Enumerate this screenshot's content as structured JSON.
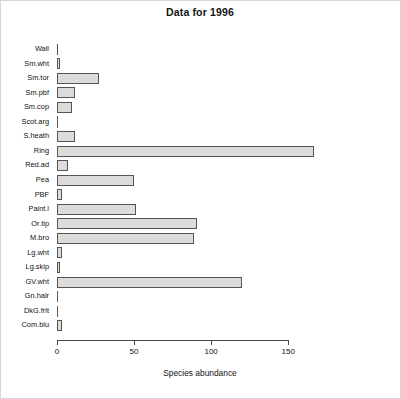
{
  "chart_data": {
    "type": "bar",
    "orientation": "horizontal",
    "title": "Data for 1996",
    "xlabel": "Species abundance",
    "ylabel": "",
    "xlim": [
      0,
      170
    ],
    "xticks": [
      0,
      50,
      100,
      150
    ],
    "xtick_labels": [
      "0",
      "50",
      "100",
      "150"
    ],
    "grid": false,
    "legend": null,
    "bar_fill_color": "#dcdcdc",
    "bar_border_color": "#555555",
    "categories": [
      "Wall",
      "Sm.wht",
      "Sm.tor",
      "Sm.pbf",
      "Sm.cop",
      "Scot.arg",
      "S.heath",
      "Ring",
      "Red.ad",
      "Pea",
      "PBF",
      "Paint.l",
      "Or.tip",
      "M.bro",
      "Lg.wht",
      "Lg.skip",
      "GV.wht",
      "Gn.hair",
      "DkG.frit",
      "Com.blu"
    ],
    "values": [
      0,
      2,
      27,
      12,
      10,
      0,
      12,
      167,
      7,
      50,
      3,
      51,
      91,
      89,
      3,
      2,
      120,
      0,
      0,
      3
    ]
  },
  "axis": {
    "x_title": "Species abundance"
  }
}
